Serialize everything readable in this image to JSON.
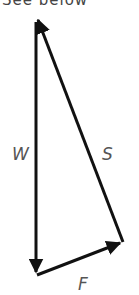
{
  "header": {
    "cut_text": "See below"
  },
  "diagram": {
    "type": "vector-triangle",
    "vectors": [
      {
        "label": "W",
        "from": [
          36,
          18
        ],
        "to": [
          36,
          275
        ]
      },
      {
        "label": "F",
        "from": [
          36,
          275
        ],
        "to": [
          123,
          242
        ]
      },
      {
        "label": "S",
        "from": [
          123,
          242
        ],
        "to": [
          36,
          18
        ]
      }
    ],
    "labels": {
      "w": "W",
      "s": "S",
      "f": "F"
    },
    "stroke_color": "#111111"
  }
}
